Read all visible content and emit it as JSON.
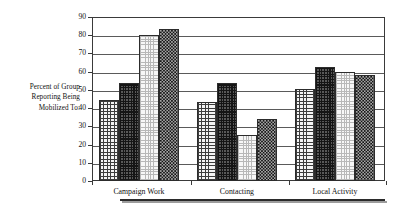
{
  "axis_caption": {
    "line1": "Percent of Group",
    "line2": "Reporting Being",
    "line3": "Mobilized To:"
  },
  "chart_data": {
    "type": "bar",
    "title": "",
    "subtitle": "",
    "xlabel": "",
    "ylabel": "Percent of Group Reporting Being Mobilized To:",
    "ylim": [
      0,
      90
    ],
    "ytick_step": 10,
    "yticks": [
      "90",
      "80",
      "70",
      "60",
      "50",
      "40",
      "30",
      "20",
      "10",
      "0"
    ],
    "grid": true,
    "legend_position": "none",
    "categories": [
      "Campaign Work",
      "Contacting",
      "Local Activity"
    ],
    "series": [
      {
        "name": "Series 1",
        "pattern": "light-grid",
        "values": [
          44.5,
          43.5,
          50.5
        ]
      },
      {
        "name": "Series 2",
        "pattern": "dark-grid",
        "values": [
          54.0,
          54.0,
          62.5
        ]
      },
      {
        "name": "Series 3",
        "pattern": "light-dots",
        "values": [
          80.0,
          25.5,
          60.0
        ]
      },
      {
        "name": "Series 4",
        "pattern": "dark-checkerboard",
        "values": [
          83.5,
          34.0,
          58.0
        ]
      }
    ]
  }
}
